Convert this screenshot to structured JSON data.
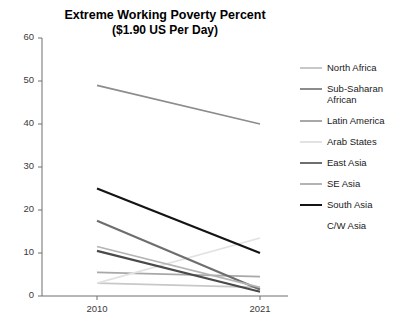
{
  "chart_data": {
    "type": "line",
    "title": "Extreme Working Poverty Percent",
    "subtitle": "($1.90 US Per Day)",
    "xlabel": "",
    "ylabel": "",
    "x": [
      "2010",
      "2021"
    ],
    "xticklabels": [
      "2010",
      "2021"
    ],
    "yticklabels": [
      "0",
      "10",
      "20",
      "30",
      "40",
      "50",
      "60"
    ],
    "ylim": [
      0,
      60
    ],
    "ytick_step": 10,
    "grid": false,
    "legend_position": "right",
    "series": [
      {
        "name": "North Africa",
        "values": [
          3.0,
          2.0
        ],
        "color": "#c8c8c8"
      },
      {
        "name": "Sub-Saharan African",
        "values": [
          49.0,
          40.0
        ],
        "color": "#8c8c8c"
      },
      {
        "name": "Latin America",
        "values": [
          5.5,
          4.5
        ],
        "color": "#a8a8a8"
      },
      {
        "name": "Arab States",
        "values": [
          3.0,
          13.5
        ],
        "color": "#e2e2e2"
      },
      {
        "name": "East Asia",
        "values": [
          17.5,
          1.5
        ],
        "color": "#6e6e6e"
      },
      {
        "name": "SE Asia",
        "values": [
          11.5,
          2.0
        ],
        "color": "#b4b4b4"
      },
      {
        "name": "South Asia",
        "values": [
          25.0,
          10.0
        ],
        "color": "#141414"
      },
      {
        "name": "C/W Asia",
        "values": [
          10.5,
          1.0
        ],
        "color": "#4a4a4a"
      }
    ]
  },
  "legend": {
    "items": [
      {
        "label": "North Africa"
      },
      {
        "label": "Sub-Saharan African"
      },
      {
        "label": "Latin America"
      },
      {
        "label": "Arab States"
      },
      {
        "label": "East Asia"
      },
      {
        "label": "SE Asia"
      },
      {
        "label": "South Asia"
      },
      {
        "label": "C/W Asia"
      }
    ]
  }
}
